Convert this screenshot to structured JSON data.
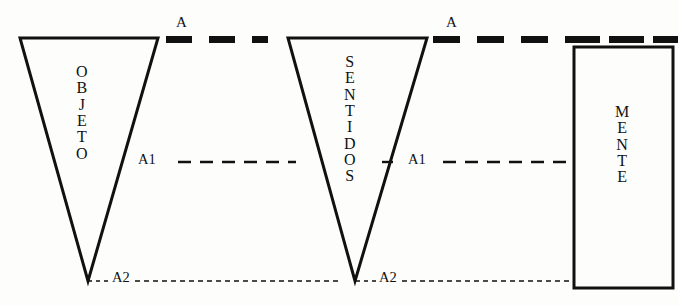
{
  "diagram": {
    "background_color": "#fdfdfb",
    "stroke_color": "#111111",
    "shapes": [
      {
        "id": "objeto",
        "kind": "inverted-triangle",
        "label": "OBJETO",
        "letters": [
          "O",
          "B",
          "J",
          "E",
          "T",
          "O"
        ]
      },
      {
        "id": "sentidos",
        "kind": "inverted-triangle",
        "label": "SENTIDOS",
        "letters": [
          "S",
          "E",
          "N",
          "T",
          "I",
          "D",
          "O",
          "S"
        ]
      },
      {
        "id": "mente",
        "kind": "rectangle",
        "label": "MENTE",
        "letters": [
          "M",
          "E",
          "N",
          "T",
          "E"
        ]
      }
    ],
    "levels": [
      {
        "id": "level-a",
        "label": "A",
        "style": "thick-dash",
        "left_marker": "A",
        "right_marker": "A"
      },
      {
        "id": "level-a1",
        "label": "A1",
        "style": "medium-dash",
        "left_marker": "A1",
        "right_marker": "A1"
      },
      {
        "id": "level-a2",
        "label": "A2",
        "style": "fine-dot",
        "left_marker": "A2",
        "right_marker": "A2"
      }
    ],
    "markers": {
      "a_left": "A",
      "a_right": "A",
      "a1_left": "A1",
      "a1_right": "A1",
      "a2_left": "A2",
      "a2_right": "A2"
    }
  }
}
